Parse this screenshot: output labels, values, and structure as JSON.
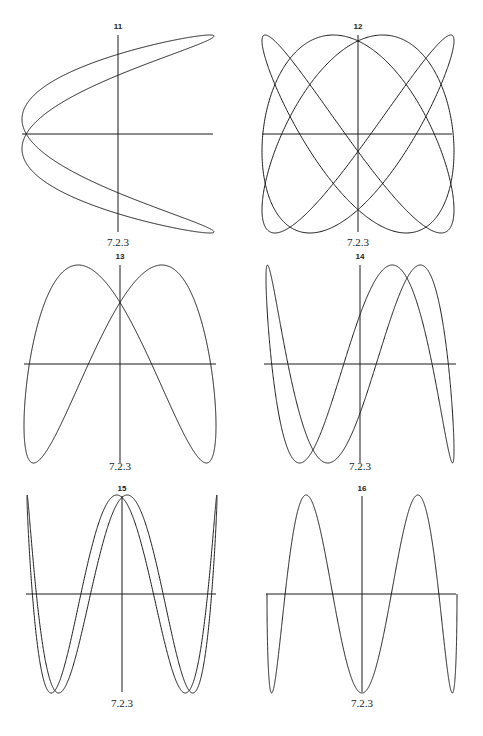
{
  "panels": [
    {
      "id": "11",
      "label": "11",
      "caption": "7.2.3",
      "cx": 118,
      "cy": 134,
      "ax": 96,
      "ay": 99,
      "axis": {
        "x1": 22,
        "x2": 213,
        "y1": 35,
        "y2": 232
      },
      "curve": {
        "fx": 2,
        "fy": 1,
        "phase": 0.3,
        "mode": "negcos",
        "t_end": 6.2832
      },
      "label_y": 29,
      "caption_y": 246
    },
    {
      "id": "12",
      "label": "12",
      "caption": "7.2.3",
      "cx": 358,
      "cy": 134,
      "ax": 96,
      "ay": 99,
      "axis": {
        "x1": 262,
        "x2": 452,
        "y1": 35,
        "y2": 232
      },
      "curve": {
        "fx": 3,
        "fy": 4,
        "phase": 0.26,
        "mode": "sin",
        "t_end": 6.2832
      },
      "label_y": 29,
      "caption_y": 246
    },
    {
      "id": "13",
      "label": "13",
      "caption": "7.2.3",
      "cx": 120,
      "cy": 364,
      "ax": 96,
      "ay": 99,
      "axis": {
        "x1": 24,
        "x2": 216,
        "y1": 265,
        "y2": 463
      },
      "curve": {
        "fx": 1,
        "fy": 2,
        "phase": 0.45,
        "mode": "sin",
        "t_end": 6.2832
      },
      "label_y": 259,
      "caption_y": 470
    },
    {
      "id": "14",
      "label": "14",
      "caption": "7.2.3",
      "cx": 360,
      "cy": 364,
      "ax": 94,
      "ay": 99,
      "axis": {
        "x1": 264,
        "x2": 456,
        "y1": 265,
        "y2": 463
      },
      "curve": {
        "fx": 1,
        "fy": 3,
        "phase": 0.35,
        "mode": "sin",
        "t_end": 6.2832
      },
      "label_y": 259,
      "caption_y": 470
    },
    {
      "id": "15",
      "label": "15",
      "caption": "7.2.3",
      "cx": 122,
      "cy": 594,
      "ax": 95,
      "ay": 99,
      "axis": {
        "x1": 26,
        "x2": 216,
        "y1": 496,
        "y2": 692
      },
      "curve": {
        "fx": 1,
        "fy": 4,
        "phase": 0.22,
        "mode": "cosy",
        "t_end": 6.2832
      },
      "label_y": 491,
      "caption_y": 707
    },
    {
      "id": "16",
      "label": "16",
      "caption": "7.2.3",
      "cx": 362,
      "cy": 594,
      "ax": 95,
      "ay": 99,
      "axis": {
        "x1": 266,
        "x2": 456,
        "y1": 496,
        "y2": 692
      },
      "curve": {
        "fx": 1,
        "fy": 5,
        "phase": 0.0,
        "mode": "sin",
        "t_end": 3.1416
      },
      "label_y": 491,
      "caption_y": 707
    }
  ]
}
